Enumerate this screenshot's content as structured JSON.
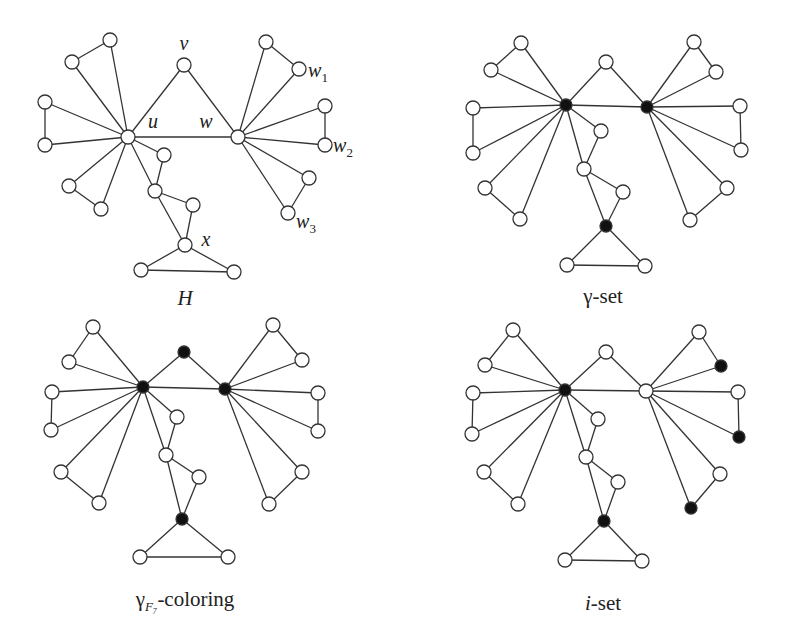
{
  "figure": {
    "panels": [
      {
        "id": "H",
        "caption": "H",
        "caption_italic": true,
        "caption_pos": [
          185,
          305
        ],
        "nodes": {
          "a1": [
            72,
            62
          ],
          "a2": [
            110,
            40
          ],
          "v": [
            184,
            65
          ],
          "b1": [
            266,
            42
          ],
          "w1": [
            299,
            69
          ],
          "c1": [
            45,
            102
          ],
          "c2": [
            45,
            145
          ],
          "u": [
            128,
            137
          ],
          "w": [
            238,
            137
          ],
          "w2a": [
            325,
            106
          ],
          "w2": [
            325,
            145
          ],
          "d1": [
            69,
            186
          ],
          "d2": [
            101,
            209
          ],
          "p1": [
            164,
            155
          ],
          "p2": [
            155,
            191
          ],
          "p3": [
            193,
            205
          ],
          "x": [
            185,
            245
          ],
          "e1": [
            141,
            270
          ],
          "e2": [
            234,
            272
          ],
          "w3a": [
            309,
            178
          ],
          "w3": [
            288,
            213
          ]
        },
        "black": [],
        "labels": [
          {
            "text": "v",
            "x": 184,
            "y": 50
          },
          {
            "text": "u",
            "x": 153,
            "y": 128
          },
          {
            "text": "w",
            "x": 206,
            "y": 128
          },
          {
            "text": "w",
            "sub": "1",
            "x": 318,
            "y": 77
          },
          {
            "text": "w",
            "sub": "2",
            "x": 343,
            "y": 152
          },
          {
            "text": "w",
            "sub": "3",
            "x": 306,
            "y": 228
          },
          {
            "text": "x",
            "x": 206,
            "y": 246
          }
        ]
      },
      {
        "id": "gamma-set",
        "caption": "γ-set",
        "caption_italic": false,
        "caption_pos": [
          603,
          303
        ],
        "nodes": {
          "a1": [
            491,
            70
          ],
          "a2": [
            521,
            43
          ],
          "v": [
            606,
            62
          ],
          "b1": [
            694,
            42
          ],
          "w1": [
            716,
            72
          ],
          "c1": [
            473,
            108
          ],
          "c2": [
            473,
            153
          ],
          "u": [
            566,
            105
          ],
          "w": [
            647,
            107
          ],
          "w2a": [
            740,
            106
          ],
          "w2": [
            741,
            150
          ],
          "d1": [
            485,
            188
          ],
          "d2": [
            520,
            219
          ],
          "p1": [
            601,
            131
          ],
          "p2": [
            584,
            169
          ],
          "p3": [
            623,
            192
          ],
          "x": [
            606,
            226
          ],
          "e1": [
            567,
            265
          ],
          "e2": [
            645,
            266
          ],
          "w3a": [
            727,
            188
          ],
          "w3": [
            690,
            220
          ]
        },
        "black": [
          "u",
          "w",
          "x"
        ],
        "labels": []
      },
      {
        "id": "gamma-F7-coloring",
        "caption": "γ",
        "caption_sub": "F₇",
        "caption_rest": "-coloring",
        "caption_italic": false,
        "caption_pos": [
          185,
          606
        ],
        "nodes": {
          "a1": [
            69,
            362
          ],
          "a2": [
            93,
            327
          ],
          "v": [
            184,
            352
          ],
          "b1": [
            273,
            325
          ],
          "w1": [
            302,
            360
          ],
          "c1": [
            52,
            392
          ],
          "c2": [
            51,
            430
          ],
          "u": [
            143,
            387
          ],
          "w": [
            225,
            389
          ],
          "w2a": [
            318,
            393
          ],
          "w2": [
            318,
            431
          ],
          "d1": [
            61,
            472
          ],
          "d2": [
            99,
            503
          ],
          "p1": [
            177,
            417
          ],
          "p2": [
            166,
            455
          ],
          "p3": [
            199,
            477
          ],
          "x": [
            182,
            519
          ],
          "e1": [
            140,
            557
          ],
          "e2": [
            228,
            557
          ],
          "w3a": [
            302,
            472
          ],
          "w3": [
            269,
            504
          ]
        },
        "black": [
          "u",
          "w",
          "v",
          "x"
        ],
        "labels": []
      },
      {
        "id": "i-set",
        "caption": "i",
        "caption_rest": "-set",
        "caption_italic": false,
        "caption_pos": [
          603,
          610
        ],
        "nodes": {
          "a1": [
            485,
            365
          ],
          "a2": [
            513,
            330
          ],
          "v": [
            606,
            352
          ],
          "b1": [
            699,
            332
          ],
          "w1": [
            721,
            366
          ],
          "c1": [
            473,
            393
          ],
          "c2": [
            472,
            434
          ],
          "u": [
            565,
            390
          ],
          "w": [
            646,
            391
          ],
          "w2a": [
            738,
            392
          ],
          "w2": [
            739,
            437
          ],
          "d1": [
            484,
            472
          ],
          "d2": [
            518,
            504
          ],
          "p1": [
            598,
            419
          ],
          "p2": [
            586,
            457
          ],
          "p3": [
            618,
            482
          ],
          "x": [
            604,
            521
          ],
          "e1": [
            565,
            560
          ],
          "e2": [
            642,
            561
          ],
          "w3a": [
            720,
            474
          ],
          "w3": [
            691,
            508
          ]
        },
        "black": [
          "u",
          "w1",
          "w2",
          "w3",
          "x"
        ],
        "labels": []
      }
    ],
    "edges": [
      [
        "a1",
        "a2"
      ],
      [
        "a1",
        "u"
      ],
      [
        "a2",
        "u"
      ],
      [
        "c1",
        "c2"
      ],
      [
        "c1",
        "u"
      ],
      [
        "c2",
        "u"
      ],
      [
        "d1",
        "d2"
      ],
      [
        "d1",
        "u"
      ],
      [
        "d2",
        "u"
      ],
      [
        "u",
        "v"
      ],
      [
        "v",
        "w"
      ],
      [
        "u",
        "w"
      ],
      [
        "b1",
        "w1"
      ],
      [
        "b1",
        "w"
      ],
      [
        "w1",
        "w"
      ],
      [
        "w2a",
        "w2"
      ],
      [
        "w2a",
        "w"
      ],
      [
        "w2",
        "w"
      ],
      [
        "w3a",
        "w3"
      ],
      [
        "w3a",
        "w"
      ],
      [
        "w3",
        "w"
      ],
      [
        "u",
        "p1"
      ],
      [
        "p1",
        "p2"
      ],
      [
        "u",
        "p2"
      ],
      [
        "p2",
        "p3"
      ],
      [
        "p3",
        "x"
      ],
      [
        "p2",
        "x"
      ],
      [
        "x",
        "e1"
      ],
      [
        "x",
        "e2"
      ],
      [
        "e1",
        "e2"
      ]
    ],
    "style": {
      "edge_color": "#333333",
      "node_fill_white": "#ffffff",
      "node_fill_black": "#111111",
      "node_radius": 7,
      "black_node_radius": 6
    }
  }
}
